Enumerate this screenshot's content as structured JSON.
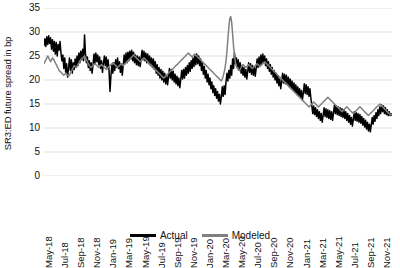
{
  "chart_data": {
    "type": "line",
    "title": "",
    "xlabel": "",
    "ylabel": "SR3:ED future spread in bp",
    "ylim": [
      0,
      35
    ],
    "ytick_labels": [
      "0",
      "5",
      "10",
      "15",
      "20",
      "25",
      "30",
      "35"
    ],
    "ytick_values": [
      0,
      5,
      10,
      15,
      20,
      25,
      30,
      35
    ],
    "grid": true,
    "grid_axis": "y",
    "legend_position": "bottom-center",
    "x_tick_labels": [
      "May-18",
      "Jul-18",
      "Sep-18",
      "Nov-18",
      "Jan-19",
      "Mar-19",
      "May-19",
      "Jul-19",
      "Sep-19",
      "Nov-19",
      "Jan-20",
      "Mar-20",
      "May-20",
      "Jul-20",
      "Sep-20",
      "Nov-20",
      "Jan-21",
      "Mar-21",
      "May-21",
      "Jul-21",
      "Sep-21",
      "Nov-21"
    ],
    "x_range_start": "May-18",
    "x_range_end": "Dec-21",
    "series": [
      {
        "name": "Actual",
        "color": "#000000",
        "values": [
          27.2,
          28.6,
          27.0,
          29.0,
          27.4,
          29.2,
          27.6,
          28.8,
          26.4,
          28.4,
          26.0,
          28.0,
          25.4,
          27.8,
          25.0,
          27.4,
          26.2,
          28.0,
          25.6,
          24.0,
          25.2,
          22.4,
          24.6,
          21.6,
          23.4,
          20.6,
          22.4,
          24.6,
          22.0,
          24.2,
          21.4,
          23.6,
          22.2,
          24.4,
          22.6,
          25.0,
          23.0,
          25.6,
          23.6,
          26.0,
          24.2,
          26.4,
          24.0,
          29.4,
          25.4,
          23.6,
          24.8,
          22.6,
          24.0,
          22.0,
          23.6,
          21.4,
          23.2,
          25.4,
          23.4,
          25.6,
          23.8,
          25.2,
          23.2,
          24.8,
          22.4,
          24.0,
          21.6,
          23.4,
          25.0,
          23.0,
          24.8,
          22.4,
          24.2,
          21.8,
          17.6,
          21.0,
          23.2,
          21.4,
          23.6,
          22.0,
          24.2,
          22.6,
          24.6,
          22.4,
          23.8,
          21.6,
          23.4,
          21.0,
          23.0,
          25.2,
          23.4,
          25.6,
          23.6,
          25.8,
          24.0,
          26.0,
          24.4,
          26.2,
          24.0,
          25.8,
          23.6,
          25.2,
          23.2,
          25.0,
          23.0,
          24.8,
          22.8,
          24.6,
          26.2,
          24.2,
          26.0,
          24.0,
          25.6,
          23.6,
          25.4,
          23.4,
          25.0,
          23.0,
          24.6,
          22.6,
          24.4,
          22.2,
          23.8,
          21.4,
          23.2,
          21.0,
          22.6,
          20.4,
          22.2,
          20.0,
          21.8,
          19.6,
          21.4,
          19.2,
          21.0,
          19.0,
          20.6,
          22.4,
          20.4,
          22.2,
          20.0,
          21.8,
          19.6,
          21.2,
          19.2,
          20.8,
          18.8,
          20.4,
          18.4,
          20.0,
          22.0,
          20.2,
          22.2,
          20.4,
          22.6,
          21.0,
          23.0,
          21.4,
          23.6,
          21.8,
          24.0,
          22.4,
          24.6,
          22.8,
          25.0,
          23.2,
          25.4,
          23.4,
          25.0,
          23.0,
          24.4,
          22.0,
          23.6,
          21.2,
          22.8,
          20.4,
          22.0,
          19.6,
          21.2,
          19.0,
          20.4,
          18.2,
          19.6,
          17.4,
          18.8,
          16.8,
          18.2,
          16.2,
          17.6,
          15.6,
          17.0,
          15.0,
          16.4,
          18.6,
          16.6,
          18.8,
          17.0,
          19.6,
          21.4,
          19.8,
          22.0,
          20.4,
          23.0,
          21.0,
          24.4,
          22.4,
          25.6,
          23.4,
          24.6,
          22.8,
          24.2,
          22.0,
          23.6,
          21.4,
          23.0,
          21.0,
          22.6,
          20.6,
          22.2,
          20.2,
          21.8,
          23.6,
          21.6,
          23.4,
          21.2,
          23.0,
          21.0,
          22.8,
          20.8,
          22.4,
          24.4,
          22.6,
          24.8,
          23.0,
          25.2,
          23.4,
          25.4,
          23.6,
          25.0,
          23.0,
          24.4,
          22.4,
          23.8,
          21.8,
          23.2,
          21.2,
          22.6,
          20.6,
          22.0,
          20.0,
          21.4,
          19.4,
          20.8,
          18.8,
          20.2,
          18.2,
          19.6,
          21.4,
          19.4,
          21.2,
          19.2,
          21.0,
          19.0,
          20.6,
          18.6,
          20.2,
          18.2,
          19.8,
          17.8,
          19.4,
          17.4,
          19.0,
          17.0,
          18.6,
          16.6,
          18.2,
          16.2,
          17.8,
          15.8,
          17.4,
          19.2,
          17.2,
          19.0,
          17.0,
          18.6,
          16.6,
          18.2,
          16.2,
          14.6,
          13.0,
          14.6,
          12.8,
          14.2,
          12.4,
          13.8,
          12.0,
          13.4,
          11.6,
          13.0,
          11.2,
          12.6,
          14.2,
          12.4,
          14.0,
          12.2,
          13.8,
          12.0,
          13.6,
          11.8,
          13.4,
          11.6,
          13.2,
          14.8,
          13.0,
          14.6,
          12.8,
          14.4,
          12.6,
          14.2,
          12.4,
          14.0,
          12.2,
          13.8,
          12.0,
          13.4,
          11.6,
          13.0,
          11.2,
          12.6,
          10.8,
          12.2,
          10.4,
          11.8,
          13.4,
          11.6,
          13.2,
          11.4,
          13.0,
          11.2,
          12.8,
          11.0,
          12.4,
          10.6,
          12.0,
          10.2,
          11.6,
          9.8,
          11.2,
          9.4,
          10.8,
          9.2,
          10.6,
          12.2,
          10.8,
          12.6,
          11.4,
          13.2,
          12.0,
          13.8,
          12.6,
          14.4,
          13.0,
          14.8,
          13.4,
          14.6,
          13.0,
          14.2,
          12.8,
          13.8,
          12.6,
          13.4,
          12.6,
          13.0,
          12.6
        ]
      },
      {
        "name": "Modeled",
        "color": "#808080",
        "values": [
          23.4,
          23.8,
          24.2,
          24.6,
          25.0,
          24.6,
          24.2,
          23.8,
          24.2,
          24.6,
          24.4,
          24.0,
          23.6,
          23.2,
          22.8,
          22.4,
          22.0,
          21.8,
          21.6,
          21.4,
          21.2,
          21.0,
          21.2,
          21.4,
          21.2,
          21.0,
          20.8,
          21.0,
          21.4,
          21.8,
          22.2,
          22.6,
          23.0,
          22.8,
          22.6,
          22.8,
          23.2,
          23.6,
          24.0,
          24.2,
          24.4,
          24.6,
          24.8,
          25.0,
          24.6,
          24.2,
          23.8,
          23.4,
          23.0,
          22.8,
          22.6,
          22.8,
          23.0,
          23.2,
          23.4,
          23.2,
          23.0,
          22.8,
          22.6,
          22.8,
          23.0,
          23.2,
          23.0,
          22.8,
          22.6,
          22.4,
          22.2,
          22.4,
          22.6,
          22.8,
          23.0,
          23.2,
          23.4,
          23.6,
          23.4,
          23.2,
          23.0,
          22.8,
          22.6,
          22.8,
          23.0,
          23.2,
          23.4,
          23.2,
          23.0,
          23.2,
          23.4,
          23.6,
          23.8,
          24.0,
          24.2,
          24.4,
          24.6,
          24.8,
          25.0,
          25.2,
          25.0,
          24.8,
          24.6,
          24.4,
          24.2,
          24.0,
          23.8,
          24.0,
          24.2,
          24.4,
          24.6,
          24.4,
          24.2,
          24.0,
          23.8,
          23.6,
          23.4,
          23.2,
          23.0,
          22.8,
          22.6,
          22.4,
          22.2,
          22.0,
          21.8,
          21.6,
          21.4,
          21.2,
          21.0,
          20.8,
          20.6,
          20.4,
          20.6,
          20.8,
          21.0,
          21.2,
          21.4,
          21.6,
          21.8,
          22.0,
          22.2,
          22.4,
          22.6,
          22.8,
          23.0,
          23.2,
          23.4,
          23.6,
          23.8,
          24.0,
          24.2,
          24.4,
          24.6,
          24.8,
          25.0,
          25.2,
          25.4,
          25.6,
          25.4,
          25.2,
          25.0,
          24.8,
          25.0,
          25.2,
          25.4,
          25.2,
          25.0,
          24.8,
          24.6,
          24.4,
          24.2,
          24.0,
          23.8,
          23.6,
          23.4,
          23.2,
          23.0,
          22.8,
          22.6,
          22.4,
          22.2,
          22.0,
          21.8,
          21.6,
          21.4,
          21.2,
          21.0,
          20.8,
          20.6,
          20.4,
          20.2,
          20.0,
          19.8,
          20.2,
          20.8,
          21.6,
          22.6,
          24.0,
          26.0,
          28.6,
          31.0,
          32.8,
          33.2,
          32.0,
          29.6,
          27.0,
          25.0,
          23.6,
          22.8,
          22.4,
          22.2,
          22.0,
          22.2,
          22.6,
          23.0,
          23.2,
          23.0,
          22.8,
          22.6,
          22.8,
          23.0,
          23.2,
          23.0,
          22.8,
          22.6,
          22.4,
          22.6,
          22.8,
          23.0,
          23.2,
          23.4,
          23.2,
          23.0,
          22.8,
          23.0,
          23.2,
          23.4,
          23.6,
          23.8,
          23.6,
          23.4,
          23.2,
          23.0,
          22.8,
          22.6,
          22.4,
          22.2,
          22.0,
          21.8,
          21.6,
          21.4,
          21.2,
          21.0,
          20.8,
          20.6,
          20.4,
          20.2,
          20.0,
          19.8,
          19.6,
          19.4,
          19.2,
          19.0,
          18.8,
          18.6,
          18.4,
          18.2,
          18.0,
          17.8,
          17.6,
          17.4,
          17.2,
          17.0,
          16.8,
          16.6,
          16.4,
          16.2,
          16.0,
          15.8,
          15.6,
          15.4,
          15.2,
          15.0,
          14.8,
          14.6,
          14.4,
          14.6,
          14.8,
          15.0,
          15.2,
          15.4,
          15.2,
          15.0,
          14.8,
          14.6,
          14.4,
          14.6,
          14.8,
          15.0,
          15.2,
          15.4,
          15.6,
          15.8,
          16.0,
          16.2,
          16.4,
          16.2,
          16.0,
          15.8,
          15.6,
          15.4,
          15.2,
          15.0,
          14.8,
          14.6,
          14.4,
          14.2,
          14.0,
          13.8,
          13.6,
          13.4,
          13.6,
          13.8,
          14.0,
          14.2,
          14.4,
          14.2,
          14.0,
          13.8,
          13.6,
          13.4,
          13.2,
          13.0,
          13.2,
          13.4,
          13.6,
          13.8,
          14.0,
          14.2,
          14.4,
          14.2,
          14.0,
          13.8,
          13.6,
          13.4,
          13.2,
          13.0,
          12.8,
          12.6,
          12.8,
          13.0,
          13.2,
          13.4,
          13.6,
          13.8,
          14.0,
          14.2,
          14.4,
          14.6,
          14.8,
          15.0,
          14.8,
          14.6,
          14.4,
          14.2,
          14.0,
          13.8,
          13.6,
          13.4,
          13.2,
          13.0,
          12.8,
          12.8,
          12.8
        ]
      }
    ]
  },
  "legend": {
    "entries": [
      {
        "label": "Actual",
        "color": "#000000"
      },
      {
        "label": "Modeled",
        "color": "#808080"
      }
    ]
  }
}
